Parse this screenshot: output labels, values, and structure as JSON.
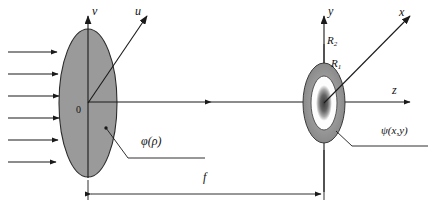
{
  "figure": {
    "background_color": "#ffffff",
    "ink_color": "#1a1a1a",
    "fill_gray": "#9a9a9a",
    "white": "#ffffff"
  },
  "input_plane": {
    "name": "left-ellipse-aperture",
    "center": {
      "x": 88,
      "y": 103
    },
    "radius_x": 29,
    "radius_y": 74,
    "fill": "#9a9a9a",
    "origin_label": "0",
    "axes": {
      "vertical": {
        "label": "v",
        "x": 88,
        "top_y": 12
      },
      "diagonal": {
        "label": "u",
        "tip_x": 150,
        "tip_y": 13
      },
      "horizontal": {
        "label": "",
        "tip_x": 215,
        "tip_y": 102
      }
    },
    "annotation": {
      "label": "φ(ρ)",
      "x": 150,
      "y": 143
    }
  },
  "incoming_wave": {
    "name": "plane-wave-arrows",
    "count": 6,
    "x_start": 8,
    "x_end": 59,
    "y_values": [
      52,
      74,
      96,
      118,
      140,
      162
    ]
  },
  "output_plane": {
    "name": "right-annulus-pattern",
    "center": {
      "x": 324,
      "y": 103
    },
    "rings": [
      {
        "name": "outer-ring",
        "label": "R2",
        "rx": 21,
        "ry": 40,
        "fill": "#8e8e8e"
      },
      {
        "name": "middle-ring",
        "label": "R1",
        "rx": 13,
        "ry": 27,
        "fill": "#ffffff"
      },
      {
        "name": "core-spot",
        "label": "",
        "rx": 6,
        "ry": 15,
        "fill": "#6b6b6b"
      }
    ],
    "axes": {
      "vertical": {
        "label": "y",
        "x": 324,
        "top_y": 12
      },
      "diagonal": {
        "label": "x",
        "tip_x": 413,
        "tip_y": 13
      },
      "horizontal": {
        "label": "z",
        "tip_x": 414,
        "tip_y": 102
      }
    },
    "annotation": {
      "label": "ψ(x,y)",
      "x": 386,
      "y": 133
    }
  },
  "labels": {
    "v_axis": "v",
    "u_axis": "u",
    "origin": "0",
    "phi": "φ(ρ)",
    "R2_base": "R",
    "R2_sub": "2",
    "R1_base": "R",
    "R1_sub": "1",
    "y_axis": "y",
    "x_axis": "x",
    "z_axis": "z",
    "psi": "ψ(x,y)",
    "focal_length": "f"
  },
  "dimension": {
    "name": "focal-length-dimension",
    "label": "f",
    "from_x": 88,
    "to_x": 324,
    "y": 194,
    "label_x": 206,
    "label_y": 178
  }
}
